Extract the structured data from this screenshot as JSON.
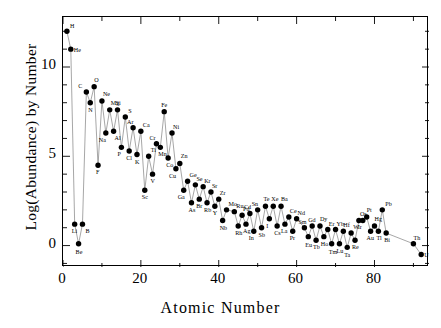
{
  "chart_data": {
    "type": "scatter",
    "title": "",
    "xlabel": "Atomic Number",
    "ylabel": "Log(Abundance) by Number",
    "xlim": [
      0,
      94
    ],
    "ylim": [
      -1.2,
      12.8
    ],
    "xticks": [
      0,
      20,
      40,
      60,
      80
    ],
    "yticks": [
      0,
      5,
      10
    ],
    "grid": false,
    "legend": null,
    "marker": "filled-circle",
    "line": "connected-thin-gray",
    "point_labels": true,
    "x": [
      1,
      2,
      3,
      4,
      5,
      6,
      7,
      8,
      9,
      10,
      11,
      12,
      13,
      14,
      15,
      16,
      17,
      18,
      19,
      20,
      21,
      22,
      23,
      24,
      25,
      26,
      27,
      28,
      29,
      30,
      31,
      32,
      33,
      34,
      35,
      36,
      37,
      38,
      39,
      40,
      41,
      42,
      44,
      45,
      46,
      47,
      48,
      49,
      50,
      51,
      52,
      53,
      54,
      55,
      56,
      57,
      58,
      59,
      60,
      62,
      63,
      64,
      65,
      66,
      67,
      68,
      69,
      70,
      71,
      72,
      73,
      74,
      75,
      76,
      77,
      78,
      79,
      80,
      81,
      82,
      83,
      90,
      92
    ],
    "y": [
      12.0,
      11.0,
      1.2,
      0.1,
      1.2,
      8.6,
      8.0,
      8.9,
      4.5,
      8.1,
      6.3,
      7.6,
      6.4,
      7.6,
      5.5,
      7.2,
      5.3,
      6.6,
      5.1,
      6.4,
      3.1,
      5.0,
      4.0,
      5.7,
      5.5,
      7.5,
      4.9,
      6.3,
      4.3,
      4.6,
      3.1,
      3.6,
      2.4,
      3.4,
      2.6,
      3.3,
      2.4,
      3.0,
      2.2,
      2.6,
      1.4,
      2.0,
      1.9,
      1.1,
      1.7,
      1.2,
      1.8,
      0.8,
      2.0,
      1.0,
      2.2,
      1.5,
      2.2,
      1.1,
      2.2,
      1.2,
      1.6,
      0.8,
      1.5,
      1.0,
      0.5,
      1.1,
      0.3,
      1.1,
      0.5,
      0.9,
      0.1,
      0.9,
      0.1,
      0.8,
      -0.1,
      0.7,
      0.3,
      1.4,
      1.4,
      1.6,
      0.8,
      1.1,
      0.8,
      2.0,
      0.7,
      0.1,
      -0.5
    ],
    "labels": [
      "H",
      "He",
      "Li",
      "Be",
      "B",
      "C",
      "N",
      "O",
      "F",
      "Ne",
      "Na",
      "Mg",
      "Al",
      "Si",
      "P",
      "S",
      "Cl",
      "Ar",
      "K",
      "Ca",
      "Sc",
      "Ti",
      "V",
      "Cr",
      "Mn",
      "Fe",
      "Co",
      "Ni",
      "Cu",
      "Zn",
      "Ga",
      "Ge",
      "As",
      "Se",
      "Br",
      "Kr",
      "Rb",
      "Sr",
      "Y",
      "Zr",
      "Nb",
      "Mo",
      "Ru",
      "Rh",
      "Pd",
      "Ag",
      "Cd",
      "In",
      "Sn",
      "Sb",
      "Te",
      "I",
      "Xe",
      "Cs",
      "Ba",
      "La",
      "Ce",
      "Pr",
      "Nd",
      "Sm",
      "Eu",
      "Gd",
      "Tb",
      "Dy",
      "Ho",
      "Er",
      "Tm",
      "Yb",
      "Lu",
      "Hf",
      "Ta",
      "W",
      "Re",
      "Os",
      "Ir",
      "Pt",
      "Au",
      "Hg",
      "Tl",
      "Pb",
      "Bi",
      "Th",
      "U"
    ],
    "label_offsets": [
      [
        4,
        -3
      ],
      [
        4,
        3
      ],
      [
        -2,
        9
      ],
      [
        -2,
        10
      ],
      [
        4,
        9
      ],
      [
        -7,
        -4
      ],
      [
        -1,
        9
      ],
      [
        1,
        -5
      ],
      [
        -1,
        9
      ],
      [
        2,
        -5
      ],
      [
        -6,
        9
      ],
      [
        2,
        -5
      ],
      [
        2,
        9
      ],
      [
        -1,
        -5
      ],
      [
        -3,
        9
      ],
      [
        4,
        -4
      ],
      [
        -2,
        9
      ],
      [
        -5,
        -4
      ],
      [
        -1,
        9
      ],
      [
        3,
        -4
      ],
      [
        -2,
        9
      ],
      [
        3,
        -4
      ],
      [
        -1,
        9
      ],
      [
        -6,
        -4
      ],
      [
        -1,
        9
      ],
      [
        -2,
        -5
      ],
      [
        -1,
        9
      ],
      [
        2,
        -4
      ],
      [
        -6,
        9
      ],
      [
        2,
        -5
      ],
      [
        -5,
        9
      ],
      [
        3,
        -4
      ],
      [
        -2,
        9
      ],
      [
        2,
        -4
      ],
      [
        -2,
        9
      ],
      [
        2,
        -4
      ],
      [
        -2,
        9
      ],
      [
        2,
        -4
      ],
      [
        -1,
        9
      ],
      [
        2,
        -4
      ],
      [
        -2,
        9
      ],
      [
        3,
        -4
      ],
      [
        3,
        -4
      ],
      [
        -2,
        9
      ],
      [
        2,
        -4
      ],
      [
        -2,
        9
      ],
      [
        -5,
        -4
      ],
      [
        -4,
        9
      ],
      [
        -5,
        -4
      ],
      [
        -2,
        9
      ],
      [
        -1,
        -5
      ],
      [
        -2,
        9
      ],
      [
        -1,
        -5
      ],
      [
        -2,
        9
      ],
      [
        1,
        -5
      ],
      [
        -3,
        9
      ],
      [
        2,
        -4
      ],
      [
        -2,
        9
      ],
      [
        2,
        -4
      ],
      [
        -5,
        -4
      ],
      [
        -2,
        10
      ],
      [
        -3,
        -4
      ],
      [
        -2,
        9
      ],
      [
        1,
        -5
      ],
      [
        -2,
        9
      ],
      [
        2,
        -4
      ],
      [
        -2,
        10
      ],
      [
        2,
        -4
      ],
      [
        -2,
        9
      ],
      [
        1,
        -4
      ],
      [
        -2,
        10
      ],
      [
        3,
        -4
      ],
      [
        -2,
        9
      ],
      [
        2,
        -5
      ],
      [
        -4,
        8
      ],
      [
        1,
        -5
      ],
      [
        -3,
        9
      ],
      [
        1,
        -5
      ],
      [
        -1,
        9
      ],
      [
        4,
        -4
      ],
      [
        -1,
        9
      ],
      [
        1,
        -4
      ],
      [
        4,
        2
      ]
    ]
  }
}
